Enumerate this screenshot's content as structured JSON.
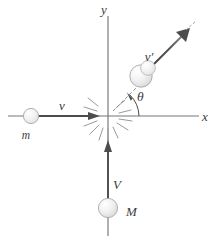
{
  "figure": {
    "name": "elastic-collision-diagram",
    "background_color": "#ffffff",
    "axis_color": "#767676",
    "vector_color": "#4d4d4d",
    "ball_fill_color": "#ededed",
    "ball_stroke_color": "#a8a8a8",
    "label_color": "#3c3c3c",
    "burst_color": "#9a9a9a"
  },
  "axes": {
    "x_label": "x",
    "y_label": "y",
    "origin": {
      "x": 108,
      "y": 116
    },
    "x_start": {
      "x": 8,
      "y": 116
    },
    "x_end": {
      "x": 199,
      "y": 116
    },
    "y_top": {
      "x": 108,
      "y": 16
    },
    "y_bottom": {
      "x": 108,
      "y": 236
    },
    "x_label_pos": {
      "x": 205,
      "y": 121
    },
    "y_label_pos": {
      "x": 104,
      "y": 14
    }
  },
  "angle": {
    "label": "θ",
    "label_pos": {
      "x": 137,
      "y": 101
    },
    "value_degrees": 45,
    "arc_radius": 30
  },
  "bodies": [
    {
      "id": "incoming-small-mass",
      "mass_label": "m",
      "mass_label_pos": {
        "x": 26,
        "y": 138
      },
      "center": {
        "x": 31,
        "y": 116
      },
      "radius": 7.5
    },
    {
      "id": "incoming-large-mass",
      "mass_label": "M",
      "mass_label_pos": {
        "x": 126,
        "y": 215
      },
      "center": {
        "x": 108,
        "y": 208
      },
      "radius": 9.5
    },
    {
      "id": "outgoing-mass",
      "mass_label": "",
      "center": {
        "x": 145,
        "y": 72
      },
      "radius": 11.0
    }
  ],
  "vectors": [
    {
      "id": "v-incoming",
      "label": "v",
      "label_pos": {
        "x": 62,
        "y": 110
      },
      "from": {
        "x": 33,
        "y": 116
      },
      "to": {
        "x": 100,
        "y": 116
      },
      "direction": "right"
    },
    {
      "id": "V-incoming",
      "label": "V",
      "label_pos": {
        "x": 112,
        "y": 188
      },
      "from": {
        "x": 108,
        "y": 200
      },
      "to": {
        "x": 108,
        "y": 142
      },
      "direction": "up"
    },
    {
      "id": "v-prime-outgoing",
      "label": "v′",
      "label_pos": {
        "x": 148,
        "y": 60
      },
      "from": {
        "x": 152,
        "y": 66
      },
      "to": {
        "x": 190,
        "y": 28
      },
      "direction": "up-right"
    }
  ],
  "reference_line": {
    "id": "angle-reference-dashed",
    "from": {
      "x": 114,
      "y": 110
    },
    "to": {
      "x": 140,
      "y": 84
    }
  },
  "impact_burst": {
    "id": "collision-burst",
    "center": {
      "x": 108,
      "y": 116
    },
    "ray_count": 12
  }
}
